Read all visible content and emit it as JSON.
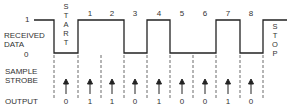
{
  "diagram": {
    "type": "serial-data-timing",
    "labels": {
      "level_high": "1",
      "level_low": "0",
      "received_data_line1": "RECEIVED",
      "received_data_line2": "DATA",
      "sample_strobe_line1": "SAMPLE",
      "sample_strobe_line2": "STROBE",
      "output": "OUTPUT"
    },
    "start_bit": [
      "S",
      "T",
      "A",
      "R",
      "T"
    ],
    "stop_bit": [
      "S",
      "T",
      "O",
      "P"
    ],
    "bit_numbers": [
      "1",
      "2",
      "3",
      "4",
      "5",
      "6",
      "7",
      "8"
    ],
    "waveform_levels": {
      "idle": 1,
      "start": 0,
      "bits": [
        1,
        1,
        0,
        1,
        0,
        0,
        1,
        0
      ],
      "stop": 1
    },
    "output_values": [
      "0",
      "1",
      "1",
      "0",
      "1",
      "0",
      "0",
      "1",
      "0"
    ],
    "line_color": "#222222"
  }
}
